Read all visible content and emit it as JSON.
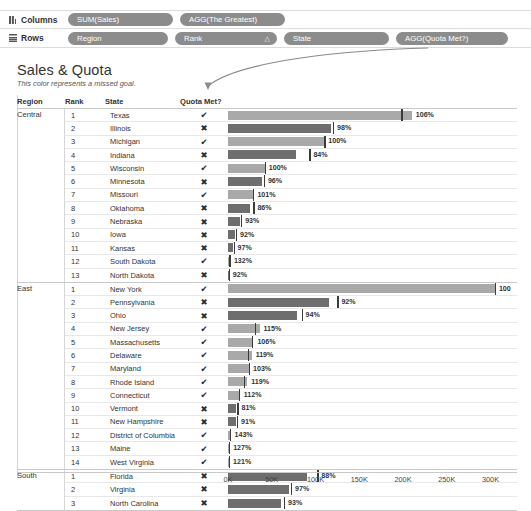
{
  "shelves": {
    "columns": {
      "label": "Columns",
      "icon": "columns-icon",
      "pills": [
        "SUM(Sales)",
        "AGG(The Greatest)"
      ]
    },
    "rows": {
      "label": "Rows",
      "icon": "rows-icon",
      "pills": [
        "Region",
        "Rank",
        "State",
        "AGG(Quota Met?)"
      ],
      "sort_glyph": "△"
    }
  },
  "title": "Sales & Quota",
  "subtitle": "This color represents a missed goal.",
  "annotation": {
    "name": "curved-arrow",
    "points_to": "Quota Met?"
  },
  "columns": [
    "Region",
    "Rank",
    "State",
    "Quota Met?"
  ],
  "marks": {
    "met": "✔",
    "missed": "✖"
  },
  "colors": {
    "met": "#a9a9a9",
    "missed": "#6e6e6e",
    "refline": "#3b3b3b"
  },
  "chart_data": {
    "type": "bar",
    "title": "Sales & Quota",
    "subtitle": "This color represents a missed goal.",
    "xlabel": "",
    "ylabel": "",
    "xlim": [
      0,
      320000
    ],
    "xticks": [
      0,
      50000,
      100000,
      150000,
      200000,
      250000,
      300000
    ],
    "xticklabels": [
      "0K",
      "50K",
      "100K",
      "150K",
      "200K",
      "250K",
      "300K"
    ],
    "grid": true,
    "legend": "none",
    "value_labels": "percent of quota",
    "reference_line": "quota",
    "groups": [
      {
        "region": "Central",
        "rows": [
          {
            "rank": "1",
            "state": "Texas",
            "quota_met": true,
            "pct": "106%",
            "sales": 210000,
            "quota": 198000
          },
          {
            "rank": "2",
            "state": "Illinois",
            "quota_met": false,
            "pct": "98%",
            "sales": 118000,
            "quota": 120000
          },
          {
            "rank": "3",
            "state": "Michigan",
            "quota_met": true,
            "pct": "100%",
            "sales": 110000,
            "quota": 110000
          },
          {
            "rank": "4",
            "state": "Indiana",
            "quota_met": false,
            "pct": "84%",
            "sales": 78000,
            "quota": 93000
          },
          {
            "rank": "5",
            "state": "Wisconsin",
            "quota_met": true,
            "pct": "100%",
            "sales": 42000,
            "quota": 42000
          },
          {
            "rank": "6",
            "state": "Minnesota",
            "quota_met": false,
            "pct": "96%",
            "sales": 39000,
            "quota": 41000
          },
          {
            "rank": "7",
            "state": "Missouri",
            "quota_met": true,
            "pct": "101%",
            "sales": 29000,
            "quota": 28500
          },
          {
            "rank": "8",
            "state": "Oklahoma",
            "quota_met": false,
            "pct": "86%",
            "sales": 25000,
            "quota": 29000
          },
          {
            "rank": "9",
            "state": "Nebraska",
            "quota_met": false,
            "pct": "93%",
            "sales": 14000,
            "quota": 15000
          },
          {
            "rank": "10",
            "state": "Iowa",
            "quota_met": false,
            "pct": "92%",
            "sales": 8500,
            "quota": 9200
          },
          {
            "rank": "11",
            "state": "Kansas",
            "quota_met": false,
            "pct": "97%",
            "sales": 6200,
            "quota": 6400
          },
          {
            "rank": "12",
            "state": "South Dakota",
            "quota_met": true,
            "pct": "132%",
            "sales": 2200,
            "quota": 1700
          },
          {
            "rank": "13",
            "state": "North Dakota",
            "quota_met": false,
            "pct": "92%",
            "sales": 900,
            "quota": 980
          }
        ]
      },
      {
        "region": "East",
        "rows": [
          {
            "rank": "1",
            "state": "New York",
            "quota_met": true,
            "pct": "100",
            "sales": 305000,
            "quota": 305000
          },
          {
            "rank": "2",
            "state": "Pennsylvania",
            "quota_met": false,
            "pct": "92%",
            "sales": 115000,
            "quota": 125000
          },
          {
            "rank": "3",
            "state": "Ohio",
            "quota_met": false,
            "pct": "94%",
            "sales": 79000,
            "quota": 84000
          },
          {
            "rank": "4",
            "state": "New Jersey",
            "quota_met": true,
            "pct": "115%",
            "sales": 36000,
            "quota": 31000
          },
          {
            "rank": "5",
            "state": "Massachusetts",
            "quota_met": true,
            "pct": "106%",
            "sales": 29000,
            "quota": 27000
          },
          {
            "rank": "6",
            "state": "Delaware",
            "quota_met": true,
            "pct": "119%",
            "sales": 27000,
            "quota": 23000
          },
          {
            "rank": "7",
            "state": "Maryland",
            "quota_met": true,
            "pct": "103%",
            "sales": 24000,
            "quota": 23500
          },
          {
            "rank": "8",
            "state": "Rhode Island",
            "quota_met": true,
            "pct": "119%",
            "sales": 22000,
            "quota": 18500
          },
          {
            "rank": "9",
            "state": "Connecticut",
            "quota_met": true,
            "pct": "112%",
            "sales": 13500,
            "quota": 12000
          },
          {
            "rank": "10",
            "state": "Vermont",
            "quota_met": false,
            "pct": "81%",
            "sales": 8800,
            "quota": 10800
          },
          {
            "rank": "11",
            "state": "New Hampshire",
            "quota_met": false,
            "pct": "91%",
            "sales": 9500,
            "quota": 10400
          },
          {
            "rank": "12",
            "state": "District of Columbia",
            "quota_met": true,
            "pct": "143%",
            "sales": 2900,
            "quota": 2000
          },
          {
            "rank": "13",
            "state": "Maine",
            "quota_met": true,
            "pct": "127%",
            "sales": 1300,
            "quota": 1000
          },
          {
            "rank": "14",
            "state": "West Virginia",
            "quota_met": true,
            "pct": "121%",
            "sales": 1200,
            "quota": 990
          }
        ]
      },
      {
        "region": "South",
        "rows": [
          {
            "rank": "1",
            "state": "Florida",
            "quota_met": false,
            "pct": "88%",
            "sales": 90000,
            "quota": 102000
          },
          {
            "rank": "2",
            "state": "Virginia",
            "quota_met": false,
            "pct": "97%",
            "sales": 70000,
            "quota": 72000
          },
          {
            "rank": "3",
            "state": "North Carolina",
            "quota_met": false,
            "pct": "93%",
            "sales": 60000,
            "quota": 64000
          }
        ]
      }
    ]
  }
}
